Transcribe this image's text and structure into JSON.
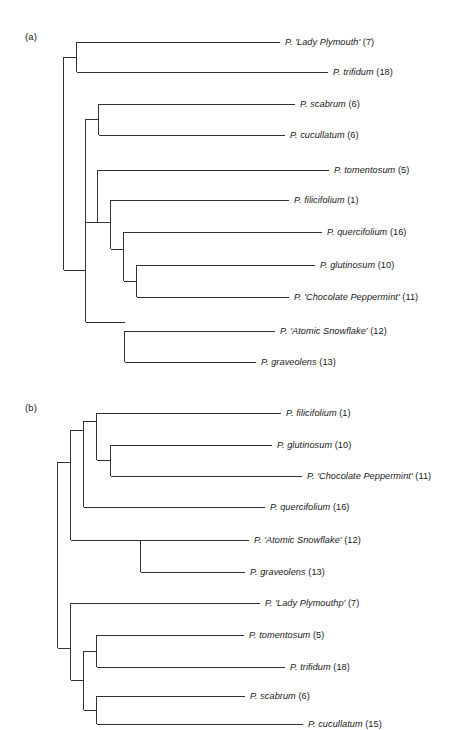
{
  "figure": {
    "background": "#ffffff",
    "line_color": "#333333",
    "text_color": "#1a1a1a"
  },
  "panels": [
    {
      "id": "a",
      "label": "(a)",
      "tips": [
        {
          "name": "P. 'Lady Plymouth'",
          "count": "(7)",
          "label_x": 285,
          "label_y": 38,
          "tip_y": 42,
          "tip_x_end": 280
        },
        {
          "name": "P. trifidum",
          "count": "(18)",
          "label_x": 333,
          "label_y": 68,
          "tip_y": 72,
          "tip_x_end": 328
        },
        {
          "name": "P. scabrum",
          "count": "(6)",
          "label_x": 300,
          "label_y": 100,
          "tip_y": 104,
          "tip_x_end": 295
        },
        {
          "name": "P. cucullatum",
          "count": "(6)",
          "label_x": 290,
          "label_y": 131,
          "tip_y": 135,
          "tip_x_end": 285
        },
        {
          "name": "P. tomentosum",
          "count": "(5)",
          "label_x": 334,
          "label_y": 166,
          "tip_y": 170,
          "tip_x_end": 329
        },
        {
          "name": "P. filicifolium",
          "count": "(1)",
          "label_x": 294,
          "label_y": 196,
          "tip_y": 200,
          "tip_x_end": 289
        },
        {
          "name": "P. quercifolium",
          "count": "(16)",
          "label_x": 327,
          "label_y": 228,
          "tip_y": 232,
          "tip_x_end": 322
        },
        {
          "name": "P. glutinosum",
          "count": "(10)",
          "label_x": 320,
          "label_y": 261,
          "tip_y": 265,
          "tip_x_end": 315
        },
        {
          "name": "P. 'Chocolate Peppermint'",
          "count": "(11)",
          "label_x": 294,
          "label_y": 293,
          "tip_y": 297,
          "tip_x_end": 289
        },
        {
          "name": "P. 'Atomic Snowflake'",
          "count": "(12)",
          "label_x": 280,
          "label_y": 327,
          "tip_y": 331,
          "tip_x_end": 275
        },
        {
          "name": "P. graveolens",
          "count": "(13)",
          "label_x": 261,
          "label_y": 358,
          "tip_y": 362,
          "tip_x_end": 256
        }
      ]
    },
    {
      "id": "b",
      "label": "(b)",
      "tips": [
        {
          "name": "P. filicifolium",
          "count": "(1)",
          "label_x": 286,
          "label_y": 409,
          "tip_y": 413,
          "tip_x_end": 281
        },
        {
          "name": "P. glutinosum",
          "count": "(10)",
          "label_x": 277,
          "label_y": 441,
          "tip_y": 445,
          "tip_x_end": 272
        },
        {
          "name": "P. 'Chocolate Peppermint'",
          "count": "(11)",
          "label_x": 307,
          "label_y": 472,
          "tip_y": 476,
          "tip_x_end": 302
        },
        {
          "name": "P. quercifolium",
          "count": "(16)",
          "label_x": 270,
          "label_y": 503,
          "tip_y": 507,
          "tip_x_end": 265
        },
        {
          "name": "P. 'Atomic Snowflake'",
          "count": "(12)",
          "label_x": 254,
          "label_y": 536,
          "tip_y": 540,
          "tip_x_end": 249
        },
        {
          "name": "P. graveolens",
          "count": "(13)",
          "label_x": 250,
          "label_y": 568,
          "tip_y": 572,
          "tip_x_end": 245
        },
        {
          "name": "P. 'Lady Plymouthp'",
          "count": "(7)",
          "label_x": 265,
          "label_y": 599,
          "tip_y": 603,
          "tip_x_end": 260
        },
        {
          "name": "P. tomentosum",
          "count": "(5)",
          "label_x": 249,
          "label_y": 631,
          "tip_y": 635,
          "tip_x_end": 244
        },
        {
          "name": "P. trifidum",
          "count": "(18)",
          "label_x": 290,
          "label_y": 663,
          "tip_y": 667,
          "tip_x_end": 285
        },
        {
          "name": "P. scabrum",
          "count": "(6)",
          "label_x": 250,
          "label_y": 692,
          "tip_y": 696,
          "tip_x_end": 245
        },
        {
          "name": "P. cucullatum",
          "count": "(15)",
          "label_x": 308,
          "label_y": 720,
          "tip_y": 724,
          "tip_x_end": 303
        }
      ]
    }
  ],
  "chart_data": {
    "type": "dendrogram",
    "title": "",
    "panels": [
      {
        "id": "a",
        "label": "(a)",
        "taxa": [
          "P. 'Lady Plymouth' (7)",
          "P. trifidum (18)",
          "P. scabrum (6)",
          "P. cucullatum (6)",
          "P. tomentosum (5)",
          "P. filicifolium (1)",
          "P. quercifolium (16)",
          "P. glutinosum (10)",
          "P. 'Chocolate Peppermint' (11)",
          "P. 'Atomic Snowflake' (12)",
          "P. graveolens (13)"
        ],
        "newick": "(('P. Lady Plymouth (7)','P. trifidum (18)'),(('P. scabrum (6)','P. cucullatum (6)'),(('P. tomentosum (5)',('P. filicifolium (1)',('P. quercifolium (16)',('P. glutinosum (10)','P. Chocolate Peppermint (11)')))),('P. Atomic Snowflake (12)','P. graveolens (13)'))));",
        "clades": [
          {
            "members": [
              "P. 'Lady Plymouth' (7)",
              "P. trifidum (18)"
            ]
          },
          {
            "members": [
              "P. scabrum (6)",
              "P. cucullatum (6)"
            ]
          },
          {
            "members": [
              "P. glutinosum (10)",
              "P. 'Chocolate Peppermint' (11)"
            ]
          },
          {
            "members": [
              "P. quercifolium (16)",
              "P. glutinosum (10)",
              "P. 'Chocolate Peppermint' (11)"
            ]
          },
          {
            "members": [
              "P. filicifolium (1)",
              "P. quercifolium (16)",
              "P. glutinosum (10)",
              "P. 'Chocolate Peppermint' (11)"
            ]
          },
          {
            "members": [
              "P. tomentosum (5)",
              "P. filicifolium (1)",
              "P. quercifolium (16)",
              "P. glutinosum (10)",
              "P. 'Chocolate Peppermint' (11)"
            ]
          },
          {
            "members": [
              "P. 'Atomic Snowflake' (12)",
              "P. graveolens (13)"
            ]
          }
        ]
      },
      {
        "id": "b",
        "label": "(b)",
        "taxa": [
          "P. filicifolium (1)",
          "P. glutinosum (10)",
          "P. 'Chocolate Peppermint' (11)",
          "P. quercifolium (16)",
          "P. 'Atomic Snowflake' (12)",
          "P. graveolens (13)",
          "P. 'Lady Plymouthp' (7)",
          "P. tomentosum (5)",
          "P. trifidum (18)",
          "P. scabrum (6)",
          "P. cucullatum (15)"
        ],
        "newick": "((('P. filicifolium (1)',('P. glutinosum (10)','P. Chocolate Peppermint (11)')),'P. quercifolium (16)'),('P. Atomic Snowflake (12)','P. graveolens (13)'),('P. Lady Plymouthp (7)',(('P. tomentosum (5)','P. trifidum (18)'),('P. scabrum (6)','P. cucullatum (15)'))));",
        "clades": [
          {
            "members": [
              "P. glutinosum (10)",
              "P. 'Chocolate Peppermint' (11)"
            ]
          },
          {
            "members": [
              "P. filicifolium (1)",
              "P. glutinosum (10)",
              "P. 'Chocolate Peppermint' (11)"
            ]
          },
          {
            "members": [
              "P. filicifolium (1)",
              "P. glutinosum (10)",
              "P. 'Chocolate Peppermint' (11)",
              "P. quercifolium (16)"
            ]
          },
          {
            "members": [
              "P. 'Atomic Snowflake' (12)",
              "P. graveolens (13)"
            ]
          },
          {
            "members": [
              "P. tomentosum (5)",
              "P. trifidum (18)"
            ]
          },
          {
            "members": [
              "P. scabrum (6)",
              "P. cucullatum (15)"
            ]
          },
          {
            "members": [
              "P. tomentosum (5)",
              "P. trifidum (18)",
              "P. scabrum (6)",
              "P. cucullatum (15)"
            ]
          },
          {
            "members": [
              "P. 'Lady Plymouthp' (7)",
              "P. tomentosum (5)",
              "P. trifidum (18)",
              "P. scabrum (6)",
              "P. cucullatum (15)"
            ]
          }
        ]
      }
    ]
  }
}
